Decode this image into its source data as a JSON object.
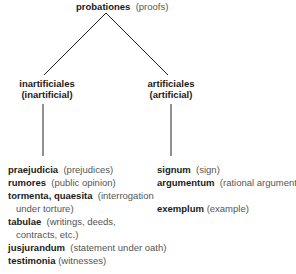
{
  "root": {
    "term": "probationes",
    "gloss": "(proofs)"
  },
  "left": {
    "term": "inartificiales",
    "gloss": "(inartificial)",
    "items": [
      {
        "term": "praejudicia",
        "gloss": "(prejudices)"
      },
      {
        "term": "rumores",
        "gloss": "(public opinion)"
      },
      {
        "term": "tormenta, quaesita",
        "gloss": "(interrogation",
        "cont": "under torture)"
      },
      {
        "term": "tabulae",
        "gloss": "(writings, deeds,",
        "cont": "contracts, etc.)"
      },
      {
        "term": "jusjurandum",
        "gloss": "(statement under oath)"
      },
      {
        "term": "testimonia",
        "gloss": "(witnesses)"
      }
    ]
  },
  "right": {
    "term": "artificiales",
    "gloss": "(artificial)",
    "items": [
      {
        "term": "signum",
        "gloss": "(sign)"
      },
      {
        "term": "argumentum",
        "gloss": "(rational argument)"
      },
      {
        "term": "exemplum",
        "gloss": "(example)"
      }
    ]
  }
}
